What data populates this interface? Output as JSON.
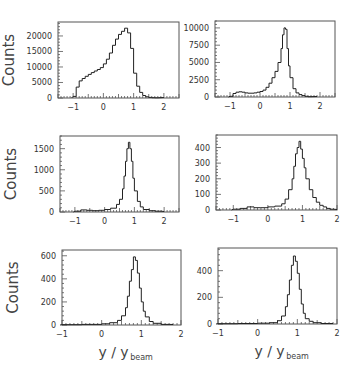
{
  "chart_data": [
    {
      "type": "bar",
      "style": "step-histogram",
      "panel": "top-left",
      "ylabel": "Counts",
      "xlabel": "",
      "xlim": [
        -1.5,
        2.5
      ],
      "ylim": [
        0,
        24500
      ],
      "xticks": [
        -1,
        0,
        1,
        2
      ],
      "yticks": [
        0,
        5000,
        10000,
        15000,
        20000
      ],
      "x": [
        -1.0,
        -0.9,
        -0.8,
        -0.7,
        -0.6,
        -0.5,
        -0.4,
        -0.3,
        -0.2,
        -0.1,
        0.0,
        0.1,
        0.2,
        0.3,
        0.4,
        0.5,
        0.6,
        0.7,
        0.8,
        0.9,
        1.0,
        1.1,
        1.2,
        1.3,
        1.4,
        1.5,
        1.6,
        1.7
      ],
      "values": [
        500,
        3500,
        5500,
        6300,
        7000,
        7600,
        8200,
        8700,
        9200,
        9800,
        11000,
        12500,
        14500,
        17000,
        19000,
        20500,
        21500,
        22500,
        21000,
        16000,
        8000,
        3800,
        1800,
        800,
        400,
        200,
        100,
        50
      ]
    },
    {
      "type": "bar",
      "style": "step-histogram",
      "panel": "top-right",
      "ylabel": "",
      "xlabel": "",
      "xlim": [
        -1.5,
        2.5
      ],
      "ylim": [
        0,
        11000
      ],
      "xticks": [
        -1,
        0,
        1,
        2
      ],
      "yticks": [
        0,
        2500,
        5000,
        7500,
        10000
      ],
      "x": [
        -1.0,
        -0.9,
        -0.8,
        -0.7,
        -0.6,
        -0.5,
        -0.4,
        -0.3,
        -0.2,
        -0.1,
        0.0,
        0.1,
        0.2,
        0.3,
        0.4,
        0.5,
        0.6,
        0.7,
        0.75,
        0.8,
        0.85,
        0.9,
        0.95,
        1.0,
        1.1,
        1.2,
        1.3,
        1.4,
        1.5,
        1.6
      ],
      "values": [
        100,
        500,
        700,
        750,
        700,
        600,
        550,
        550,
        600,
        700,
        800,
        1000,
        1400,
        2000,
        2800,
        3700,
        5000,
        7000,
        9000,
        10000,
        9800,
        7000,
        4500,
        2800,
        1200,
        600,
        350,
        200,
        100,
        50
      ]
    },
    {
      "type": "bar",
      "style": "step-histogram",
      "panel": "middle-left",
      "ylabel": "Counts",
      "xlabel": "",
      "xlim": [
        -1.5,
        2.5
      ],
      "ylim": [
        0,
        1800
      ],
      "xticks": [
        -1,
        0,
        1,
        2
      ],
      "yticks": [
        0,
        500,
        1000,
        1500
      ],
      "x": [
        -1.0,
        -0.8,
        -0.6,
        -0.4,
        -0.2,
        0.0,
        0.2,
        0.4,
        0.5,
        0.6,
        0.65,
        0.7,
        0.75,
        0.8,
        0.85,
        0.9,
        0.95,
        1.0,
        1.1,
        1.2,
        1.3,
        1.5,
        1.7
      ],
      "values": [
        20,
        50,
        40,
        30,
        40,
        60,
        90,
        180,
        300,
        550,
        850,
        1200,
        1500,
        1650,
        1500,
        1200,
        800,
        500,
        250,
        120,
        60,
        30,
        20
      ]
    },
    {
      "type": "bar",
      "style": "step-histogram",
      "panel": "middle-right",
      "ylabel": "",
      "xlabel": "",
      "xlim": [
        -1.5,
        2.0
      ],
      "ylim": [
        0,
        480
      ],
      "xticks": [
        -1,
        0,
        1,
        2
      ],
      "yticks": [
        0,
        100,
        200,
        300,
        400
      ],
      "x": [
        -1.0,
        -0.8,
        -0.6,
        -0.4,
        -0.2,
        0.0,
        0.2,
        0.4,
        0.5,
        0.6,
        0.7,
        0.75,
        0.8,
        0.85,
        0.9,
        0.95,
        1.0,
        1.05,
        1.1,
        1.2,
        1.3,
        1.4,
        1.5,
        1.6,
        1.7,
        1.8
      ],
      "values": [
        5,
        10,
        20,
        15,
        15,
        20,
        25,
        40,
        70,
        130,
        200,
        280,
        360,
        400,
        440,
        390,
        330,
        270,
        200,
        130,
        80,
        50,
        30,
        20,
        10,
        5
      ]
    },
    {
      "type": "bar",
      "style": "step-histogram",
      "panel": "bottom-left",
      "ylabel": "Counts",
      "xlabel": "y/y_beam",
      "xlim": [
        -1.0,
        2.0
      ],
      "ylim": [
        0,
        650
      ],
      "xticks": [
        -1,
        0,
        1,
        2
      ],
      "yticks": [
        0,
        200,
        400,
        600
      ],
      "x": [
        -1.0,
        -0.5,
        0.0,
        0.2,
        0.4,
        0.5,
        0.6,
        0.65,
        0.7,
        0.75,
        0.8,
        0.85,
        0.9,
        0.95,
        1.0,
        1.05,
        1.1,
        1.2,
        1.3,
        1.5
      ],
      "values": [
        3,
        5,
        10,
        20,
        40,
        80,
        150,
        250,
        380,
        480,
        590,
        560,
        450,
        320,
        200,
        120,
        70,
        30,
        15,
        5
      ]
    },
    {
      "type": "bar",
      "style": "step-histogram",
      "panel": "bottom-right",
      "ylabel": "",
      "xlabel": "y/y_beam",
      "xlim": [
        -1.0,
        2.0
      ],
      "ylim": [
        0,
        570
      ],
      "xticks": [
        -1,
        0,
        1,
        2
      ],
      "yticks": [
        0,
        200,
        400
      ],
      "x": [
        -1.0,
        -0.5,
        0.0,
        0.3,
        0.5,
        0.6,
        0.7,
        0.75,
        0.8,
        0.85,
        0.9,
        0.95,
        1.0,
        1.05,
        1.1,
        1.15,
        1.2,
        1.3,
        1.4,
        1.6
      ],
      "values": [
        2,
        4,
        6,
        10,
        25,
        60,
        130,
        220,
        330,
        440,
        510,
        470,
        380,
        260,
        150,
        80,
        40,
        20,
        10,
        4
      ]
    }
  ],
  "labels": {
    "counts": "Counts",
    "x_main": "y / y",
    "x_sub": "beam"
  }
}
